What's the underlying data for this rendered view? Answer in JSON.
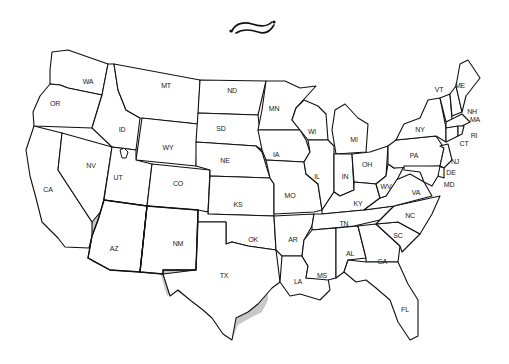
{
  "map": {
    "title_ornament": "tilde-flourish",
    "region_highlighted": "Southwest",
    "colors": {
      "background": "#ffffff",
      "state_fill": "#ffffff",
      "state_stroke": "#111111",
      "highlight_fill": "#c8c8c8"
    },
    "highlighted_states": [
      "CA",
      "AZ",
      "NM",
      "TX",
      "OK"
    ],
    "labels": {
      "WA": "WA",
      "OR": "OR",
      "CA": "CA",
      "ID": "ID",
      "NV": "NV",
      "MT": "MT",
      "WY": "WY",
      "UT": "UT",
      "CO": "CO",
      "AZ": "AZ",
      "NM": "NM",
      "ND": "ND",
      "SD": "SD",
      "NE": "NE",
      "KS": "KS",
      "OK": "OK",
      "TX": "TX",
      "MN": "MN",
      "IA": "IA",
      "MO": "MO",
      "AR": "AR",
      "LA": "LA",
      "WI": "WI",
      "IL": "IL",
      "MI": "MI",
      "IN": "IN",
      "OH": "OH",
      "KY": "KY",
      "TN": "TN",
      "MS": "MS",
      "AL": "AL",
      "GA": "GA",
      "FL": "FL",
      "SC": "SC",
      "NC": "NC",
      "VA": "VA",
      "WV": "WV",
      "PA": "PA",
      "NY": "NY",
      "VT": "VT",
      "NH": "NH",
      "ME": "ME",
      "MA": "MA",
      "RI": "RI",
      "CT": "CT",
      "NJ": "NJ",
      "DE": "DE",
      "MD": "MD"
    }
  }
}
